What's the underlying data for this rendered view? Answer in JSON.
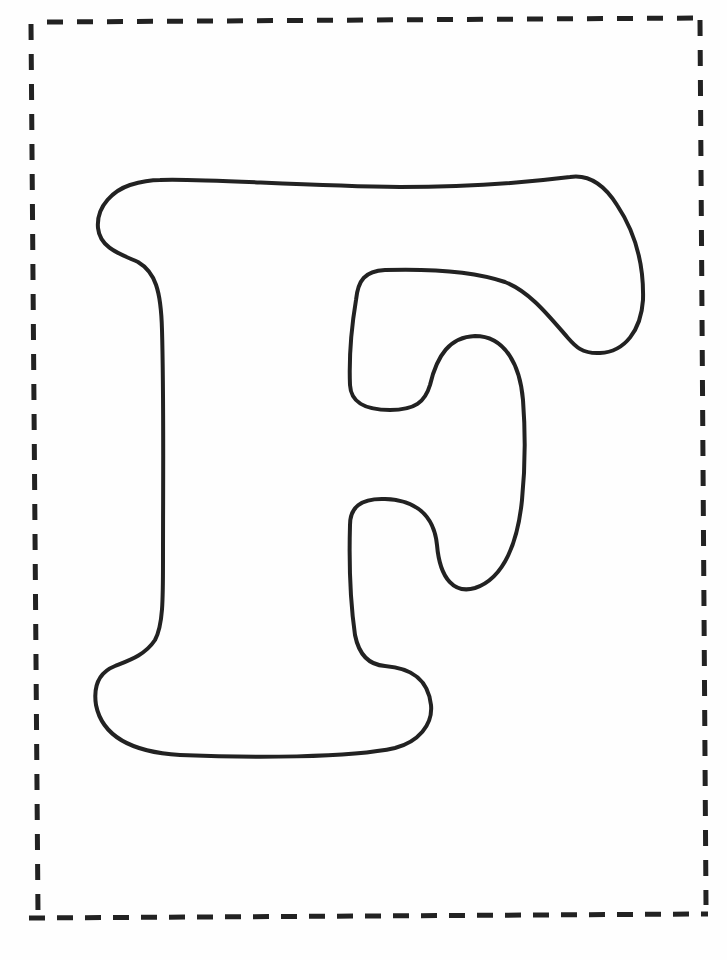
{
  "page": {
    "background": "#fefefe",
    "ink_color": "#222222"
  },
  "border": {
    "style": "dashed",
    "description": "Dashed cut-out border around the letter"
  },
  "letter": {
    "character": "F",
    "style": "outline bubble letter for coloring"
  }
}
